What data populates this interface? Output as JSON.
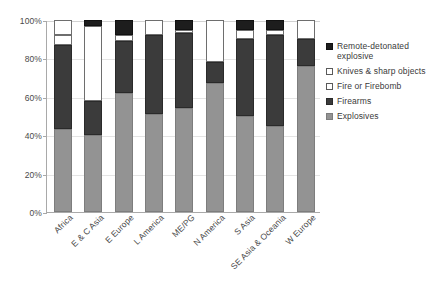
{
  "chart_data": {
    "type": "bar",
    "subtype": "stacked-percentage-column",
    "title": "",
    "xlabel": "",
    "ylabel": "",
    "ylim": [
      0,
      100
    ],
    "ytick_labels": [
      "0%",
      "20%",
      "40%",
      "60%",
      "80%",
      "100%"
    ],
    "ytick_values": [
      0,
      20,
      40,
      60,
      80,
      100
    ],
    "grid": true,
    "legend_position": "right",
    "stack_order_bottom_to_top": [
      "Explosives",
      "Firearms",
      "Fire or Firebomb",
      "Knives & sharp objects",
      "Remote-detonated explosive"
    ],
    "categories": [
      "Africa",
      "E & C Asia",
      "E Europe",
      "L America",
      "ME/PG",
      "N America",
      "S Asia",
      "SE Asia & Oceania",
      "W Europe"
    ],
    "series": [
      {
        "name": "Explosives",
        "color": "#939393",
        "values": [
          43,
          40,
          62,
          51,
          54,
          67,
          50,
          45,
          76
        ]
      },
      {
        "name": "Firearms",
        "color": "#3b3b3b",
        "values": [
          44,
          18,
          27,
          41,
          39,
          11,
          40,
          47,
          14
        ]
      },
      {
        "name": "Fire or Firebomb",
        "color": "#ffffff",
        "values": [
          5,
          0,
          3,
          0,
          2,
          0,
          5,
          3,
          0
        ]
      },
      {
        "name": "Knives & sharp objects",
        "color": "#ffffff",
        "values": [
          8,
          39,
          0,
          8,
          0,
          22,
          0,
          0,
          10
        ]
      },
      {
        "name": "Remote-detonated explosive",
        "color": "#1d1d1d",
        "values": [
          0,
          3,
          8,
          0,
          5,
          0,
          5,
          5,
          0
        ]
      }
    ]
  },
  "legend": {
    "entries": [
      {
        "label": "Remote-detonated explosive",
        "swatch": "dark"
      },
      {
        "label": "Knives & sharp objects",
        "swatch": "open"
      },
      {
        "label": "Fire or Firebomb",
        "swatch": "open"
      },
      {
        "label": "Firearms",
        "swatch": "firearms"
      },
      {
        "label": "Explosives",
        "swatch": "gray"
      }
    ]
  }
}
